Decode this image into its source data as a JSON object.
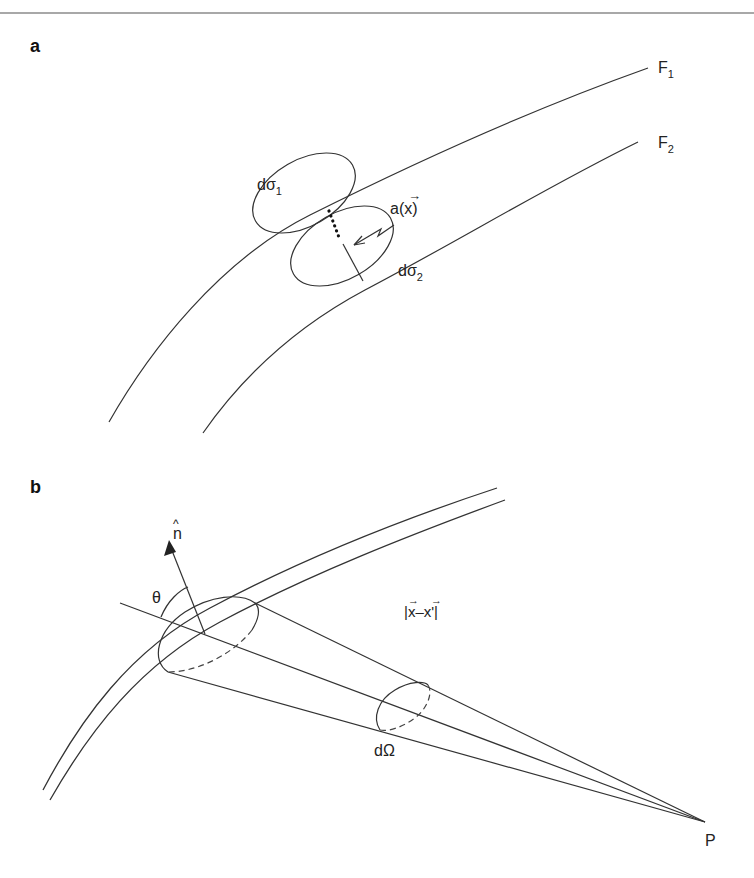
{
  "panels": {
    "a": {
      "label": "a",
      "surface_1": {
        "name": "F",
        "sub": "1"
      },
      "surface_2": {
        "name": "F",
        "sub": "2"
      },
      "element_1": {
        "name": "dσ",
        "sub": "1"
      },
      "element_2": {
        "name": "dσ",
        "sub": "2"
      },
      "vector_label": "a(x)",
      "vector_arrow": "→"
    },
    "b": {
      "label": "b",
      "normal": "n",
      "normal_hat": "^",
      "angle": "θ",
      "distance": "|x–x'|",
      "distance_arrow": "→",
      "solid_angle": "dΩ",
      "point": "P"
    }
  },
  "colors": {
    "line": "#333333",
    "text": "#222222",
    "rule": "#a8a8a8"
  }
}
